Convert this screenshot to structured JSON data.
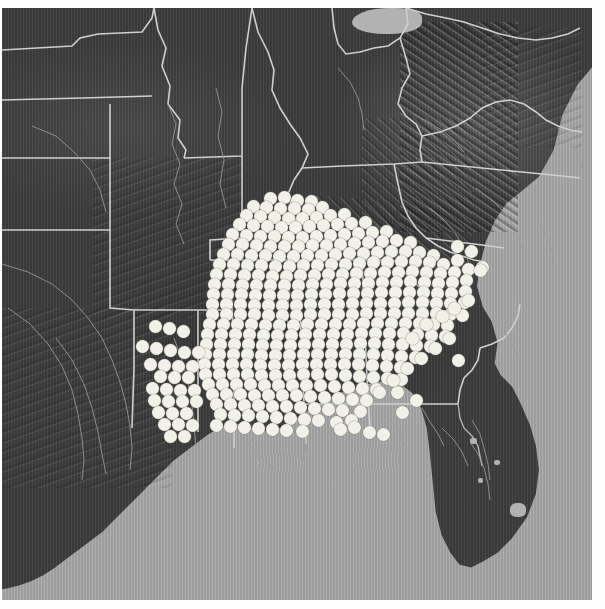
{
  "map": {
    "title": "Species occurrence distribution map",
    "region": "Southeastern United States",
    "projection": "shaded relief raster basemap",
    "basemap_style": "grayscale shaded relief",
    "colors": {
      "ocean": "#a6a6a6",
      "land": "#3d3d3d",
      "boundary_line": "#cfcfcf",
      "river_line": "#9a9a9a",
      "occurrence_dot": "#f2f1e9",
      "page_background": "#fefefe"
    },
    "frame": {
      "left": 2,
      "top": 8,
      "width": 590,
      "height": 592
    },
    "legend_present": false,
    "scalebar_present": false,
    "labels_present": false,
    "symbol": {
      "shape": "filled-circle",
      "diameter_px": 13,
      "fill": "#f2f1e9",
      "meaning": "occurrence record"
    },
    "water_features": [
      {
        "name": "gulf-of-mexico"
      },
      {
        "name": "atlantic-ocean"
      },
      {
        "name": "lake-erie"
      },
      {
        "name": "lake-okeechobee"
      }
    ],
    "landforms": [
      {
        "name": "appalachian-mountains"
      },
      {
        "name": "florida-peninsula"
      },
      {
        "name": "mississippi-river-valley"
      },
      {
        "name": "gulf-coastal-plain"
      }
    ],
    "occurrence_summary": {
      "core_extent": "Mississippi, Alabama, Georgia, Louisiana, Florida panhandle, South Carolina",
      "northern_limit_y": 190,
      "southern_limit_y": 430,
      "western_limit_x": 135,
      "eastern_limit_x": 480
    }
  },
  "chart_data": {
    "type": "scatter",
    "xlabel": "",
    "ylabel": "",
    "grid": false,
    "legend": "none",
    "xlim": [
      0,
      590
    ],
    "ylim": [
      0,
      592
    ],
    "note": "Dot positions are map pixel coordinates within the map frame; each dot marks one occurrence record.",
    "points": [
      [
        268,
        190
      ],
      [
        282,
        189
      ],
      [
        295,
        192
      ],
      [
        309,
        193
      ],
      [
        251,
        198
      ],
      [
        264,
        199
      ],
      [
        278,
        200
      ],
      [
        292,
        200
      ],
      [
        306,
        201
      ],
      [
        320,
        199
      ],
      [
        244,
        207
      ],
      [
        258,
        208
      ],
      [
        272,
        209
      ],
      [
        286,
        210
      ],
      [
        300,
        210
      ],
      [
        314,
        209
      ],
      [
        328,
        207
      ],
      [
        342,
        206
      ],
      [
        237,
        216
      ],
      [
        251,
        217
      ],
      [
        265,
        218
      ],
      [
        279,
        219
      ],
      [
        293,
        219
      ],
      [
        307,
        218
      ],
      [
        321,
        217
      ],
      [
        335,
        216
      ],
      [
        349,
        215
      ],
      [
        363,
        214
      ],
      [
        230,
        226
      ],
      [
        244,
        227
      ],
      [
        258,
        228
      ],
      [
        272,
        228
      ],
      [
        286,
        229
      ],
      [
        300,
        229
      ],
      [
        314,
        228
      ],
      [
        328,
        227
      ],
      [
        342,
        226
      ],
      [
        356,
        225
      ],
      [
        370,
        224
      ],
      [
        384,
        223
      ],
      [
        226,
        236
      ],
      [
        240,
        236
      ],
      [
        254,
        237
      ],
      [
        268,
        238
      ],
      [
        282,
        238
      ],
      [
        296,
        238
      ],
      [
        310,
        237
      ],
      [
        324,
        237
      ],
      [
        338,
        236
      ],
      [
        352,
        235
      ],
      [
        366,
        234
      ],
      [
        380,
        233
      ],
      [
        394,
        232
      ],
      [
        408,
        234
      ],
      [
        221,
        246
      ],
      [
        235,
        246
      ],
      [
        249,
        247
      ],
      [
        263,
        247
      ],
      [
        277,
        248
      ],
      [
        291,
        248
      ],
      [
        305,
        247
      ],
      [
        319,
        247
      ],
      [
        333,
        246
      ],
      [
        347,
        245
      ],
      [
        361,
        245
      ],
      [
        375,
        244
      ],
      [
        389,
        243
      ],
      [
        403,
        243
      ],
      [
        417,
        244
      ],
      [
        431,
        247
      ],
      [
        217,
        256
      ],
      [
        231,
        256
      ],
      [
        245,
        257
      ],
      [
        259,
        257
      ],
      [
        273,
        258
      ],
      [
        287,
        258
      ],
      [
        301,
        257
      ],
      [
        315,
        257
      ],
      [
        329,
        256
      ],
      [
        343,
        256
      ],
      [
        357,
        255
      ],
      [
        371,
        254
      ],
      [
        385,
        254
      ],
      [
        399,
        253
      ],
      [
        413,
        253
      ],
      [
        427,
        254
      ],
      [
        441,
        256
      ],
      [
        455,
        252
      ],
      [
        214,
        266
      ],
      [
        228,
        266
      ],
      [
        242,
        267
      ],
      [
        256,
        267
      ],
      [
        270,
        268
      ],
      [
        284,
        268
      ],
      [
        298,
        267
      ],
      [
        312,
        267
      ],
      [
        326,
        266
      ],
      [
        340,
        266
      ],
      [
        354,
        265
      ],
      [
        368,
        265
      ],
      [
        382,
        264
      ],
      [
        396,
        264
      ],
      [
        410,
        263
      ],
      [
        424,
        264
      ],
      [
        438,
        265
      ],
      [
        452,
        264
      ],
      [
        466,
        261
      ],
      [
        480,
        259
      ],
      [
        212,
        276
      ],
      [
        226,
        276
      ],
      [
        240,
        277
      ],
      [
        254,
        277
      ],
      [
        268,
        277
      ],
      [
        282,
        277
      ],
      [
        296,
        277
      ],
      [
        310,
        276
      ],
      [
        324,
        276
      ],
      [
        338,
        275
      ],
      [
        352,
        275
      ],
      [
        366,
        275
      ],
      [
        380,
        274
      ],
      [
        394,
        274
      ],
      [
        408,
        273
      ],
      [
        422,
        274
      ],
      [
        436,
        275
      ],
      [
        450,
        274
      ],
      [
        464,
        272
      ],
      [
        211,
        286
      ],
      [
        225,
        286
      ],
      [
        239,
        286
      ],
      [
        253,
        287
      ],
      [
        267,
        287
      ],
      [
        281,
        287
      ],
      [
        295,
        287
      ],
      [
        309,
        286
      ],
      [
        323,
        286
      ],
      [
        337,
        285
      ],
      [
        351,
        285
      ],
      [
        365,
        285
      ],
      [
        379,
        284
      ],
      [
        393,
        284
      ],
      [
        407,
        284
      ],
      [
        421,
        284
      ],
      [
        435,
        285
      ],
      [
        449,
        285
      ],
      [
        463,
        283
      ],
      [
        210,
        296
      ],
      [
        224,
        296
      ],
      [
        238,
        296
      ],
      [
        252,
        297
      ],
      [
        266,
        297
      ],
      [
        280,
        297
      ],
      [
        294,
        297
      ],
      [
        308,
        296
      ],
      [
        322,
        296
      ],
      [
        336,
        296
      ],
      [
        350,
        295
      ],
      [
        364,
        295
      ],
      [
        378,
        295
      ],
      [
        392,
        295
      ],
      [
        406,
        294
      ],
      [
        420,
        294
      ],
      [
        434,
        295
      ],
      [
        448,
        295
      ],
      [
        462,
        294
      ],
      [
        210,
        306
      ],
      [
        224,
        306
      ],
      [
        238,
        306
      ],
      [
        252,
        306
      ],
      [
        266,
        307
      ],
      [
        280,
        307
      ],
      [
        294,
        307
      ],
      [
        308,
        306
      ],
      [
        322,
        306
      ],
      [
        336,
        306
      ],
      [
        350,
        306
      ],
      [
        364,
        305
      ],
      [
        378,
        305
      ],
      [
        392,
        305
      ],
      [
        406,
        305
      ],
      [
        420,
        305
      ],
      [
        434,
        305
      ],
      [
        448,
        306
      ],
      [
        460,
        307
      ],
      [
        207,
        316
      ],
      [
        221,
        316
      ],
      [
        235,
        316
      ],
      [
        249,
        316
      ],
      [
        263,
        317
      ],
      [
        277,
        317
      ],
      [
        291,
        317
      ],
      [
        305,
        316
      ],
      [
        319,
        316
      ],
      [
        333,
        316
      ],
      [
        347,
        316
      ],
      [
        361,
        315
      ],
      [
        375,
        315
      ],
      [
        389,
        315
      ],
      [
        403,
        315
      ],
      [
        417,
        315
      ],
      [
        431,
        316
      ],
      [
        445,
        317
      ],
      [
        205,
        326
      ],
      [
        219,
        326
      ],
      [
        233,
        326
      ],
      [
        247,
        326
      ],
      [
        261,
        327
      ],
      [
        275,
        327
      ],
      [
        289,
        327
      ],
      [
        303,
        326
      ],
      [
        317,
        326
      ],
      [
        331,
        326
      ],
      [
        345,
        326
      ],
      [
        359,
        325
      ],
      [
        373,
        325
      ],
      [
        387,
        325
      ],
      [
        401,
        325
      ],
      [
        415,
        326
      ],
      [
        429,
        327
      ],
      [
        443,
        328
      ],
      [
        204,
        336
      ],
      [
        218,
        336
      ],
      [
        232,
        336
      ],
      [
        246,
        336
      ],
      [
        260,
        337
      ],
      [
        274,
        337
      ],
      [
        288,
        337
      ],
      [
        302,
        336
      ],
      [
        316,
        336
      ],
      [
        330,
        336
      ],
      [
        344,
        336
      ],
      [
        358,
        335
      ],
      [
        372,
        335
      ],
      [
        386,
        336
      ],
      [
        400,
        336
      ],
      [
        414,
        337
      ],
      [
        428,
        338
      ],
      [
        456,
        352
      ],
      [
        203,
        346
      ],
      [
        217,
        346
      ],
      [
        231,
        346
      ],
      [
        245,
        346
      ],
      [
        259,
        347
      ],
      [
        273,
        347
      ],
      [
        287,
        347
      ],
      [
        301,
        346
      ],
      [
        315,
        346
      ],
      [
        329,
        346
      ],
      [
        343,
        346
      ],
      [
        357,
        346
      ],
      [
        371,
        346
      ],
      [
        385,
        347
      ],
      [
        399,
        348
      ],
      [
        413,
        349
      ],
      [
        202,
        356
      ],
      [
        216,
        356
      ],
      [
        230,
        356
      ],
      [
        244,
        356
      ],
      [
        258,
        357
      ],
      [
        272,
        357
      ],
      [
        286,
        357
      ],
      [
        300,
        356
      ],
      [
        314,
        356
      ],
      [
        328,
        356
      ],
      [
        342,
        356
      ],
      [
        356,
        356
      ],
      [
        370,
        357
      ],
      [
        384,
        358
      ],
      [
        398,
        359
      ],
      [
        203,
        366
      ],
      [
        217,
        366
      ],
      [
        231,
        366
      ],
      [
        245,
        366
      ],
      [
        259,
        367
      ],
      [
        273,
        367
      ],
      [
        287,
        367
      ],
      [
        301,
        366
      ],
      [
        315,
        366
      ],
      [
        329,
        366
      ],
      [
        343,
        367
      ],
      [
        357,
        368
      ],
      [
        371,
        369
      ],
      [
        385,
        370
      ],
      [
        399,
        371
      ],
      [
        206,
        376
      ],
      [
        220,
        376
      ],
      [
        234,
        376
      ],
      [
        248,
        376
      ],
      [
        262,
        377
      ],
      [
        276,
        377
      ],
      [
        290,
        377
      ],
      [
        304,
        377
      ],
      [
        318,
        377
      ],
      [
        332,
        378
      ],
      [
        346,
        379
      ],
      [
        360,
        380
      ],
      [
        374,
        381
      ],
      [
        395,
        384
      ],
      [
        210,
        386
      ],
      [
        224,
        386
      ],
      [
        238,
        386
      ],
      [
        252,
        387
      ],
      [
        266,
        387
      ],
      [
        280,
        387
      ],
      [
        294,
        387
      ],
      [
        308,
        388
      ],
      [
        322,
        389
      ],
      [
        336,
        390
      ],
      [
        350,
        391
      ],
      [
        364,
        392
      ],
      [
        214,
        396
      ],
      [
        228,
        396
      ],
      [
        242,
        397
      ],
      [
        256,
        397
      ],
      [
        270,
        398
      ],
      [
        284,
        398
      ],
      [
        298,
        399
      ],
      [
        312,
        400
      ],
      [
        326,
        401
      ],
      [
        340,
        402
      ],
      [
        358,
        403
      ],
      [
        218,
        406
      ],
      [
        232,
        407
      ],
      [
        246,
        407
      ],
      [
        260,
        408
      ],
      [
        274,
        409
      ],
      [
        288,
        410
      ],
      [
        302,
        411
      ],
      [
        316,
        412
      ],
      [
        334,
        414
      ],
      [
        349,
        412
      ],
      [
        214,
        417
      ],
      [
        228,
        418
      ],
      [
        242,
        419
      ],
      [
        256,
        420
      ],
      [
        270,
        421
      ],
      [
        284,
        422
      ],
      [
        300,
        423
      ],
      [
        338,
        421
      ],
      [
        352,
        419
      ],
      [
        367,
        424
      ],
      [
        381,
        426
      ],
      [
        153,
        318
      ],
      [
        167,
        320
      ],
      [
        181,
        323
      ],
      [
        140,
        338
      ],
      [
        154,
        340
      ],
      [
        168,
        342
      ],
      [
        182,
        344
      ],
      [
        196,
        344
      ],
      [
        148,
        356
      ],
      [
        162,
        357
      ],
      [
        176,
        358
      ],
      [
        190,
        358
      ],
      [
        158,
        368
      ],
      [
        172,
        369
      ],
      [
        186,
        369
      ],
      [
        150,
        380
      ],
      [
        164,
        381
      ],
      [
        178,
        382
      ],
      [
        192,
        382
      ],
      [
        152,
        392
      ],
      [
        166,
        393
      ],
      [
        180,
        393
      ],
      [
        194,
        393
      ],
      [
        156,
        404
      ],
      [
        170,
        405
      ],
      [
        184,
        405
      ],
      [
        162,
        416
      ],
      [
        176,
        416
      ],
      [
        190,
        417
      ],
      [
        168,
        428
      ],
      [
        182,
        428
      ],
      [
        455,
        238
      ],
      [
        469,
        243
      ],
      [
        478,
        262
      ],
      [
        466,
        292
      ],
      [
        452,
        300
      ],
      [
        440,
        308
      ],
      [
        424,
        316
      ],
      [
        410,
        330
      ],
      [
        447,
        330
      ],
      [
        433,
        340
      ],
      [
        419,
        350
      ],
      [
        405,
        360
      ],
      [
        391,
        372
      ],
      [
        377,
        384
      ],
      [
        400,
        404
      ],
      [
        414,
        392
      ]
    ]
  }
}
